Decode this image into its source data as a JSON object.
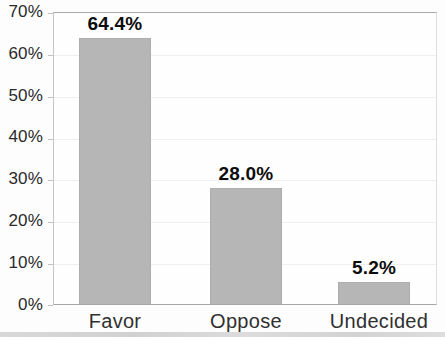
{
  "chart_data": {
    "type": "bar",
    "categories": [
      "Favor",
      "Oppose",
      "Undecided"
    ],
    "values": [
      64.4,
      28.0,
      5.2
    ],
    "value_labels": [
      "64.4%",
      "28.0%",
      "5.2%"
    ],
    "y_ticks": [
      "70%",
      "60%",
      "50%",
      "40%",
      "30%",
      "20%",
      "10%",
      "0%"
    ],
    "ylim": [
      0,
      70
    ],
    "y_tick_step": 10,
    "title": "",
    "xlabel": "",
    "ylabel": "",
    "grid": true,
    "legend": false,
    "bar_color": "#b6b6b6",
    "label_color": "#0d0d0d"
  }
}
